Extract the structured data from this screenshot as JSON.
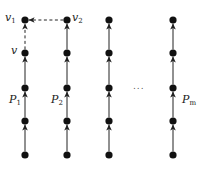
{
  "diagram": {
    "type": "path-graph",
    "colors": {
      "node": "#111111",
      "edge": "#222222",
      "dashed_edge": "#222222"
    },
    "node_radius": 3.6,
    "columns": [
      {
        "id": "P1",
        "label": "P",
        "label_sub": "1",
        "x": 25
      },
      {
        "id": "P2",
        "label": "P",
        "label_sub": "2",
        "x": 67
      },
      {
        "id": "P3",
        "label": "",
        "label_sub": "",
        "x": 109
      },
      {
        "id": "Pm",
        "label": "P",
        "label_sub": "m",
        "x": 173
      }
    ],
    "rows_y": [
      20,
      53,
      88,
      121,
      155
    ],
    "node_labels": {
      "v1": {
        "base": "v",
        "sub": "1"
      },
      "v2": {
        "base": "v",
        "sub": "2"
      },
      "v": {
        "base": "v",
        "sub": ""
      }
    },
    "ellipsis": "...",
    "edges_note": "Each column is a directed path pointing upward; column P1 top edge (v to v1) is dashed; dashed arrow from v2 to v1."
  }
}
